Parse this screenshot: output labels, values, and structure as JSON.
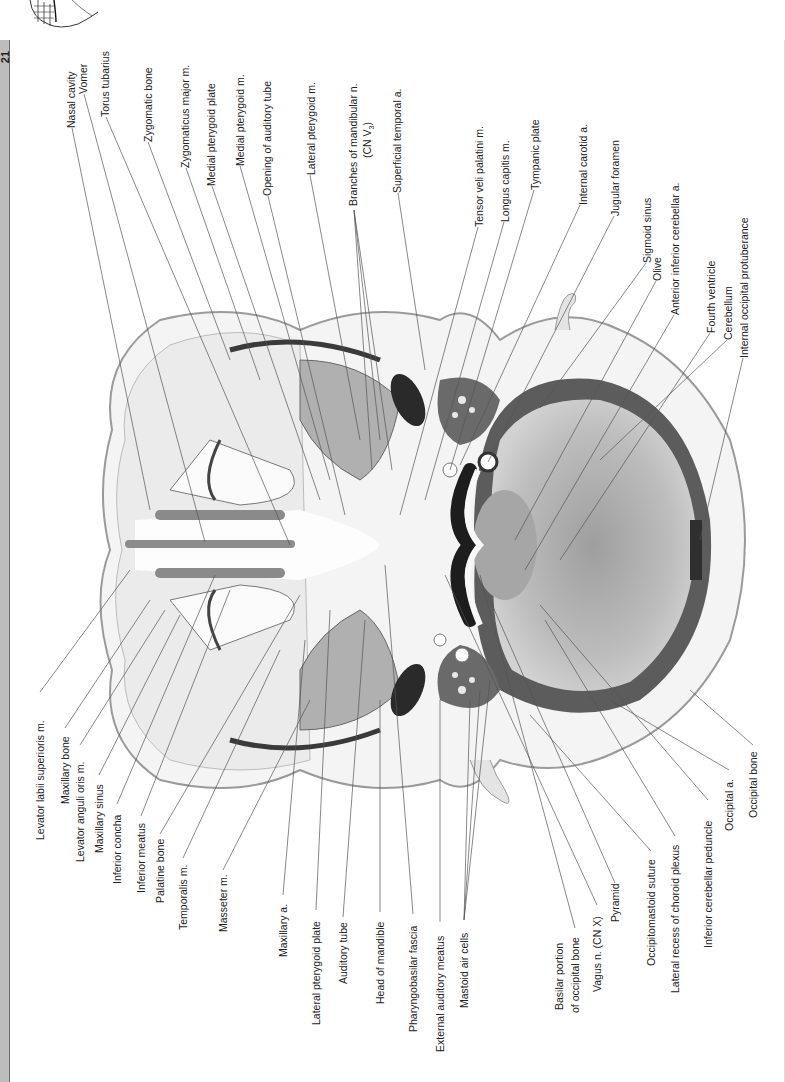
{
  "page": {
    "number": "21"
  },
  "figure": {
    "orientation": "rotated-90",
    "labels_top": [
      {
        "id": "nasal-cavity",
        "text": "Nasal cavity",
        "x": 66,
        "y": 128
      },
      {
        "id": "vomer",
        "text": "Vomer",
        "x": 78,
        "y": 94
      },
      {
        "id": "torus-tubarius",
        "text": "Torus tubarius",
        "x": 100,
        "y": 117
      },
      {
        "id": "zygomatic-bone",
        "text": "Zygomatic bone",
        "x": 143,
        "y": 142
      },
      {
        "id": "zygomaticus-major",
        "text": "Zygomaticus major m.",
        "x": 180,
        "y": 168
      },
      {
        "id": "medial-pterygoid-plate",
        "text": "Medial pterygoid plate",
        "x": 206,
        "y": 186
      },
      {
        "id": "medial-pterygoid-m",
        "text": "Medial pterygoid m.",
        "x": 235,
        "y": 166
      },
      {
        "id": "opening-auditory-tube",
        "text": "Opening of auditory tube",
        "x": 262,
        "y": 196
      },
      {
        "id": "lateral-pterygoid-m",
        "text": "Lateral pterygoid m.",
        "x": 306,
        "y": 175
      },
      {
        "id": "branches-mandibular-n",
        "text": "Branches of mandibular n.",
        "x": 348,
        "y": 206
      },
      {
        "id": "branches-mandibular-n-2",
        "text": "(CN V",
        "sub": "3",
        "tail": ")",
        "x": 362,
        "y": 158
      },
      {
        "id": "superficial-temporal-a",
        "text": "Superficial temporal a.",
        "x": 392,
        "y": 193
      },
      {
        "id": "tensor-veli-palatini",
        "text": "Tensor veli palatini m.",
        "x": 474,
        "y": 227
      },
      {
        "id": "longus-capitis",
        "text": "Longus capitis m.",
        "x": 500,
        "y": 222
      },
      {
        "id": "tympanic-plate",
        "text": "Tympanic plate",
        "x": 530,
        "y": 190
      },
      {
        "id": "internal-carotid-a",
        "text": "Internal carotid a.",
        "x": 578,
        "y": 205
      },
      {
        "id": "jugular-foramen",
        "text": "Jugular foramen",
        "x": 610,
        "y": 216
      },
      {
        "id": "sigmoid-sinus",
        "text": "Sigmoid sinus",
        "x": 642,
        "y": 263
      },
      {
        "id": "olive",
        "text": "Olive",
        "x": 652,
        "y": 281
      },
      {
        "id": "anterior-inferior-cerebellar-a",
        "text": "Anterior inferior cerebellar a.",
        "x": 670,
        "y": 315
      },
      {
        "id": "fourth-ventricle",
        "text": "Fourth ventricle",
        "x": 706,
        "y": 333
      },
      {
        "id": "cerebellum",
        "text": "Cerebellum",
        "x": 723,
        "y": 340
      },
      {
        "id": "internal-occipital-protuberance",
        "text": "Internal occipital protuberance",
        "x": 739,
        "y": 358
      }
    ],
    "labels_bottom": [
      {
        "id": "levator-labii-superioris",
        "text": "Levator labii superioris m.",
        "x": 35,
        "y": 692
      },
      {
        "id": "maxillary-bone",
        "text": "Maxillary bone",
        "x": 60,
        "y": 728
      },
      {
        "id": "levator-anguli-oris",
        "text": "Levator anguli oris m.",
        "x": 75,
        "y": 745
      },
      {
        "id": "maxillary-sinus",
        "text": "Maxillary sinus",
        "x": 94,
        "y": 775
      },
      {
        "id": "inferior-concha",
        "text": "Inferior concha",
        "x": 112,
        "y": 804
      },
      {
        "id": "inferior-meatus",
        "text": "Inferior meatus",
        "x": 136,
        "y": 816
      },
      {
        "id": "palatine-bone",
        "text": "Palatine bone",
        "x": 155,
        "y": 834
      },
      {
        "id": "temporalis-m",
        "text": "Temporalis m.",
        "x": 178,
        "y": 858
      },
      {
        "id": "masseter-m",
        "text": "Masseter m.",
        "x": 218,
        "y": 870
      },
      {
        "id": "maxillary-a",
        "text": "Maxillary a.",
        "x": 278,
        "y": 895
      },
      {
        "id": "lateral-pterygoid-plate",
        "text": "Lateral pterygoid plate",
        "x": 311,
        "y": 910
      },
      {
        "id": "auditory-tube",
        "text": "Auditory tube",
        "x": 338,
        "y": 917
      },
      {
        "id": "head-of-mandible",
        "text": "Head of mandible",
        "x": 375,
        "y": 912
      },
      {
        "id": "pharyngobasilar-fascia",
        "text": "Pharyngobasilar fascia",
        "x": 408,
        "y": 914
      },
      {
        "id": "external-auditory-meatus",
        "text": "External auditory meatus",
        "x": 435,
        "y": 922
      },
      {
        "id": "mastoid-air-cells",
        "text": "Mastoid air cells",
        "x": 459,
        "y": 920
      },
      {
        "id": "basilar-portion",
        "text": "Basilar portion",
        "x": 554,
        "y": 928
      },
      {
        "id": "of-occipital-bone",
        "text": "of occipital bone",
        "x": 570,
        "y": 928
      },
      {
        "id": "vagus-n",
        "text": "Vagus n. (CN X)",
        "x": 592,
        "y": 905
      },
      {
        "id": "pyramid",
        "text": "Pyramid",
        "x": 610,
        "y": 883
      },
      {
        "id": "occipitomastoid-suture",
        "text": "Occipitomastoid suture",
        "x": 646,
        "y": 851
      },
      {
        "id": "lateral-recess-choroid-plexus",
        "text": "Lateral recess of choroid plexus",
        "x": 670,
        "y": 836
      },
      {
        "id": "inferior-cerebellar-peduncle",
        "text": "Inferior cerebellar peduncle",
        "x": 703,
        "y": 800
      },
      {
        "id": "occipital-a",
        "text": "Occipital a.",
        "x": 724,
        "y": 770
      },
      {
        "id": "occipital-bone",
        "text": "Occipital bone",
        "x": 748,
        "y": 745
      }
    ]
  },
  "colors": {
    "sidebar": "#bdbdbd",
    "sidebar_border": "#6e6e6e",
    "text": "#222222",
    "leader": "#555555",
    "tissue_light": "#e6e6e6",
    "tissue_mid": "#a8a8a8",
    "tissue_dark": "#3a3a3a"
  }
}
